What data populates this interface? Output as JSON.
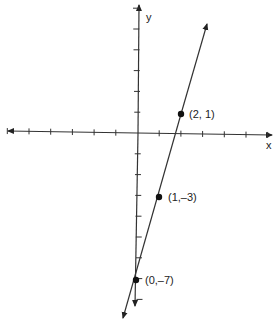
{
  "chart_data": {
    "type": "line",
    "title": "",
    "xlabel": "x",
    "ylabel": "y",
    "equation": "y = 4x - 7",
    "grid": false,
    "x_ticks": [
      -6,
      -5,
      -4,
      -3,
      -2,
      -1,
      1,
      2,
      3,
      4,
      5,
      6
    ],
    "y_ticks": [
      -8,
      -7,
      -6,
      -5,
      -4,
      -3,
      -2,
      -1,
      1,
      2,
      3,
      4,
      5,
      6
    ],
    "series": [
      {
        "name": "line",
        "points": [
          {
            "x": 2,
            "y": 1,
            "label": "(2, 1)"
          },
          {
            "x": 1,
            "y": -3,
            "label": "(1,–3)"
          },
          {
            "x": 0,
            "y": -7,
            "label": "(0,–7)"
          }
        ]
      }
    ]
  },
  "labels": {
    "x_axis": "x",
    "y_axis": "y",
    "p1": "(2, 1)",
    "p2": "(1,–3)",
    "p3": "(0,–7)"
  }
}
